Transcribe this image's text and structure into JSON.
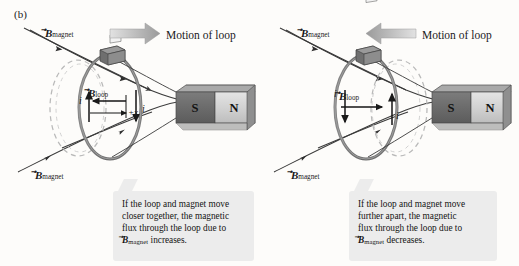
{
  "figure": {
    "panel_letter": "(b)",
    "background_color": "#fdfcfa",
    "caption_bg": "#ececec"
  },
  "panels": [
    {
      "id": "left",
      "motion_label": "Motion of loop",
      "motion_direction": "right",
      "b_magnet_top_label": "B",
      "b_magnet_top_sub": "magnet",
      "b_magnet_bottom_label": "B",
      "b_magnet_bottom_sub": "magnet",
      "b_loop_label": "B",
      "b_loop_sub": "loop",
      "b_loop_direction": "left",
      "current_left_label": "i",
      "current_left_direction": "up",
      "current_right_label": "i",
      "current_right_direction": "down",
      "axis_label": "+x",
      "axis_direction": "right",
      "magnet_near_pole": "S",
      "magnet_far_pole": "N",
      "ghost_loop_side": "left",
      "caption": {
        "line1": "If the loop and magnet move",
        "line2": "closer together, the magnetic",
        "line3": "flux through the loop due to",
        "line4_symbol": "B",
        "line4_sub": "magnet",
        "line4_rest": " increases."
      }
    },
    {
      "id": "right",
      "motion_label": "Motion of loop",
      "motion_direction": "left",
      "b_magnet_top_label": "B",
      "b_magnet_top_sub": "magnet",
      "b_magnet_bottom_label": "B",
      "b_magnet_bottom_sub": "magnet",
      "b_loop_label": "B",
      "b_loop_sub": "loop",
      "b_loop_direction": "right",
      "current_left_label": "i",
      "current_left_direction": "down",
      "current_right_label": "i",
      "current_right_direction": "up",
      "magnet_near_pole": "S",
      "magnet_far_pole": "N",
      "ghost_loop_side": "right",
      "caption": {
        "line1": "If the loop and magnet move",
        "line2": "further apart, the magnetic",
        "line3": "flux through the loop due to",
        "line4_symbol": "B",
        "line4_sub": "magnet",
        "line4_rest": " decreases."
      }
    }
  ],
  "colors": {
    "magnet_south": "#6e6e6e",
    "magnet_north": "#d2d2d2",
    "loop_stroke": "#5b5b5b",
    "ghost_stroke": "#b9b9b9",
    "field_line": "#3a3a3a",
    "motion_arrow": "#b5b5b5"
  }
}
